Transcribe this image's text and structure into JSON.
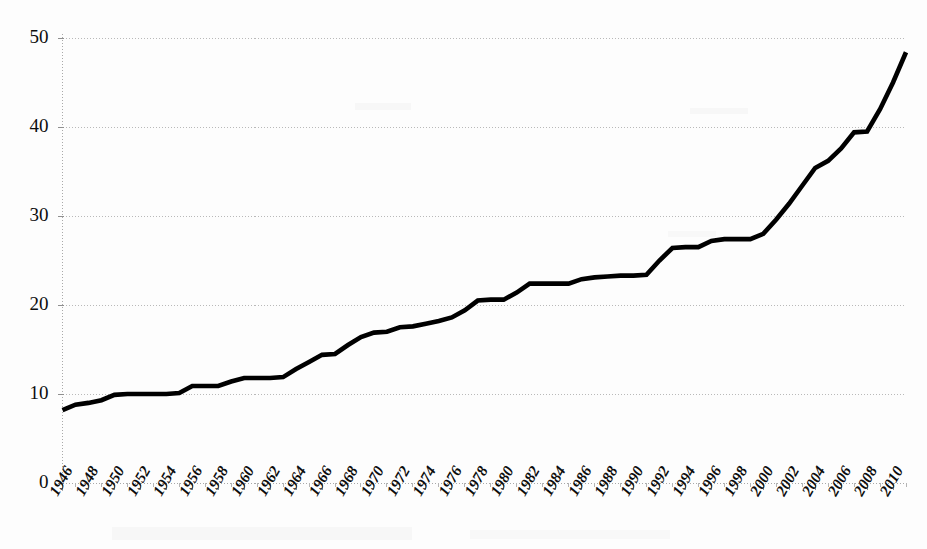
{
  "chart_data": {
    "type": "line",
    "title": "",
    "subtitle": "",
    "xlabel": "",
    "ylabel": "",
    "grid": true,
    "legend": false,
    "legend_position": "none",
    "line_color": "#000000",
    "grid_color": "#b9b9b9",
    "background_color": "#fdfdfd",
    "xlim": [
      1946,
      2011
    ],
    "ylim": [
      0,
      50
    ],
    "ytick_labels": [
      "0",
      "10",
      "20",
      "30",
      "40",
      "50"
    ],
    "ytick_values": [
      0,
      10,
      20,
      30,
      40,
      50
    ],
    "xtick_labels": [
      "1946",
      "1948",
      "1950",
      "1952",
      "1954",
      "1956",
      "1958",
      "1960",
      "1962",
      "1964",
      "1966",
      "1968",
      "1970",
      "1972",
      "1974",
      "1976",
      "1978",
      "1980",
      "1982",
      "1984",
      "1986",
      "1988",
      "1990",
      "1992",
      "1994",
      "1996",
      "1998",
      "2000",
      "2002",
      "2004",
      "2006",
      "2008",
      "2010"
    ],
    "xtick_values": [
      1946,
      1948,
      1950,
      1952,
      1954,
      1956,
      1958,
      1960,
      1962,
      1964,
      1966,
      1968,
      1970,
      1972,
      1974,
      1976,
      1978,
      1980,
      1982,
      1984,
      1986,
      1988,
      1990,
      1992,
      1994,
      1996,
      1998,
      2000,
      2002,
      2004,
      2006,
      2008,
      2010
    ],
    "x": [
      1946,
      1947,
      1948,
      1949,
      1950,
      1951,
      1952,
      1953,
      1954,
      1955,
      1956,
      1957,
      1958,
      1959,
      1960,
      1961,
      1962,
      1963,
      1964,
      1965,
      1966,
      1967,
      1968,
      1969,
      1970,
      1971,
      1972,
      1973,
      1974,
      1975,
      1976,
      1977,
      1978,
      1979,
      1980,
      1981,
      1982,
      1983,
      1984,
      1985,
      1986,
      1987,
      1988,
      1989,
      1990,
      1991,
      1992,
      1993,
      1994,
      1995,
      1996,
      1997,
      1998,
      1999,
      2000,
      2001,
      2002,
      2003,
      2004,
      2005,
      2006,
      2007,
      2008,
      2009,
      2010,
      2011
    ],
    "values": [
      8.2,
      8.8,
      9.0,
      9.3,
      9.9,
      10.0,
      10.0,
      10.0,
      10.0,
      10.1,
      10.9,
      10.9,
      10.9,
      11.4,
      11.8,
      11.8,
      11.8,
      11.9,
      12.8,
      13.6,
      14.4,
      14.5,
      15.5,
      16.4,
      16.9,
      17.0,
      17.5,
      17.6,
      17.9,
      18.2,
      18.6,
      19.4,
      20.5,
      20.6,
      20.6,
      21.4,
      22.4,
      22.4,
      22.4,
      22.4,
      22.9,
      23.1,
      23.2,
      23.3,
      23.3,
      23.4,
      25.0,
      26.4,
      26.5,
      26.5,
      27.2,
      27.4,
      27.4,
      27.4,
      28.0,
      29.6,
      31.4,
      33.4,
      35.4,
      36.2,
      37.6,
      39.4,
      39.5,
      42.0,
      45.0,
      48.4
    ],
    "series": [
      {
        "name": "series-1",
        "values": [
          8.2,
          8.8,
          9.0,
          9.3,
          9.9,
          10.0,
          10.0,
          10.0,
          10.0,
          10.1,
          10.9,
          10.9,
          10.9,
          11.4,
          11.8,
          11.8,
          11.8,
          11.9,
          12.8,
          13.6,
          14.4,
          14.5,
          15.5,
          16.4,
          16.9,
          17.0,
          17.5,
          17.6,
          17.9,
          18.2,
          18.6,
          19.4,
          20.5,
          20.6,
          20.6,
          21.4,
          22.4,
          22.4,
          22.4,
          22.4,
          22.9,
          23.1,
          23.2,
          23.3,
          23.3,
          23.4,
          25.0,
          26.4,
          26.5,
          26.5,
          27.2,
          27.4,
          27.4,
          27.4,
          28.0,
          29.6,
          31.4,
          33.4,
          35.4,
          36.2,
          37.6,
          39.4,
          39.5,
          42.0,
          45.0,
          48.4
        ]
      }
    ],
    "annotations": []
  }
}
